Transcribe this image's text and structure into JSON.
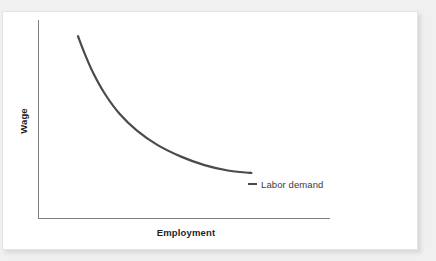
{
  "chart_data": {
    "type": "line",
    "title": "",
    "subtitle": "",
    "xlabel": "Employment",
    "ylabel": "Wage",
    "grid": false,
    "legend_position": "inline-right-end-of-curve",
    "axis_ranges": {
      "x": [
        0,
        1
      ],
      "y": [
        0,
        1
      ]
    },
    "axis_ticks": {
      "x": [],
      "y": []
    },
    "annotations": [
      {
        "name": "labor-demand-label",
        "text": "Labor demand",
        "attached_to": "labor-demand",
        "marker": "short-dash-leader"
      }
    ],
    "series": [
      {
        "name": "Labor demand",
        "shape": "convex-decreasing",
        "color": "#4a4a4a",
        "x": [
          0.137,
          0.16,
          0.19,
          0.23,
          0.28,
          0.34,
          0.41,
          0.49,
          0.57,
          0.65,
          0.725,
          0.726
        ],
        "y": [
          0.918,
          0.83,
          0.73,
          0.625,
          0.525,
          0.44,
          0.368,
          0.31,
          0.267,
          0.24,
          0.228,
          0.228
        ]
      }
    ]
  },
  "figure": {
    "card": {
      "background_color": "#ffffff",
      "border_color": "#e3e3e3"
    },
    "page_background_color": "#f0f0f0",
    "axis_color": "#808080",
    "curve_color": "#4a4a4a",
    "text_color": "#1f1f1f"
  },
  "labels": {
    "y_axis_title": "Wage",
    "x_axis_title": "Employment",
    "curve_label": "Labor demand"
  }
}
